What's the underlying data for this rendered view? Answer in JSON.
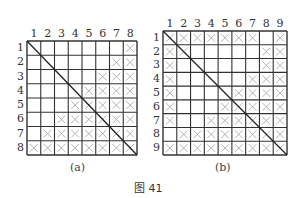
{
  "figure": {
    "caption": "图 41",
    "panels": [
      {
        "id": "a",
        "caption": "(a)",
        "size": 8,
        "col_labels": [
          "1",
          "2",
          "3",
          "4",
          "5",
          "6",
          "7",
          "8"
        ],
        "row_labels": [
          "1",
          "2",
          "3",
          "4",
          "5",
          "6",
          "7",
          "8"
        ],
        "marks": [
          [
            0,
            0,
            0,
            0,
            0,
            0,
            0,
            1
          ],
          [
            0,
            0,
            0,
            0,
            0,
            0,
            1,
            1
          ],
          [
            0,
            0,
            0,
            0,
            0,
            1,
            1,
            1
          ],
          [
            0,
            0,
            0,
            0,
            1,
            1,
            1,
            1
          ],
          [
            0,
            0,
            0,
            1,
            1,
            1,
            1,
            1
          ],
          [
            0,
            0,
            1,
            1,
            1,
            1,
            1,
            1
          ],
          [
            0,
            1,
            1,
            1,
            1,
            1,
            1,
            1
          ],
          [
            1,
            1,
            1,
            1,
            1,
            1,
            1,
            1
          ]
        ],
        "diagonal": "top-left to bottom-right"
      },
      {
        "id": "b",
        "caption": "(b)",
        "size": 9,
        "col_labels": [
          "1",
          "2",
          "3",
          "4",
          "5",
          "6",
          "7",
          "8",
          "9"
        ],
        "row_labels": [
          "1",
          "2",
          "3",
          "4",
          "5",
          "6",
          "7",
          "8",
          "9"
        ],
        "marks": [
          [
            1,
            1,
            1,
            1,
            1,
            1,
            1,
            0,
            1
          ],
          [
            1,
            1,
            0,
            0,
            0,
            0,
            0,
            1,
            1
          ],
          [
            1,
            0,
            0,
            0,
            0,
            0,
            0,
            1,
            1
          ],
          [
            1,
            0,
            0,
            0,
            0,
            0,
            1,
            1,
            1
          ],
          [
            1,
            0,
            0,
            0,
            0,
            1,
            1,
            1,
            1
          ],
          [
            1,
            0,
            0,
            0,
            1,
            1,
            1,
            1,
            1
          ],
          [
            1,
            0,
            0,
            1,
            1,
            1,
            1,
            1,
            1
          ],
          [
            0,
            1,
            1,
            1,
            1,
            1,
            1,
            1,
            1
          ],
          [
            1,
            1,
            1,
            1,
            1,
            1,
            1,
            1,
            1
          ]
        ],
        "diagonal": "top-left to bottom-right"
      }
    ],
    "colors": {
      "grid_line": "#333333",
      "mark": "#aaaaaa",
      "diagonal": "#222222"
    }
  }
}
